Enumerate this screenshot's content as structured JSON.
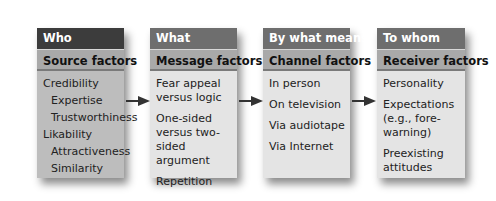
{
  "columns": [
    {
      "question": "Who",
      "factor": "Source factors",
      "items": [
        {
          "text": "Credibility",
          "level": 0
        },
        {
          "text": "Expertise",
          "level": 1
        },
        {
          "text": "Trustworthiness",
          "level": 1
        },
        {
          "text": "Likability",
          "level": 0
        },
        {
          "text": "Attractiveness",
          "level": 1
        },
        {
          "text": "Similarity",
          "level": 1
        }
      ]
    },
    {
      "question": "What",
      "factor": "Message factors",
      "items": [
        {
          "text": "Fear appeal versus logic"
        },
        {
          "text": "One-sided versus two-sided argument"
        },
        {
          "text": "Repetition"
        }
      ]
    },
    {
      "question": "By what means",
      "factor": "Channel factors",
      "items": [
        {
          "text": "In person"
        },
        {
          "text": "On television"
        },
        {
          "text": "Via audiotape"
        },
        {
          "text": "Via Internet"
        }
      ]
    },
    {
      "question": "To whom",
      "factor": "Receiver factors",
      "items": [
        {
          "text": "Personality"
        },
        {
          "text": "Expectations (e.g., fore-warning)"
        },
        {
          "text": "Preexisting attitudes"
        }
      ]
    }
  ],
  "colors": {
    "header_dark_first": "#3c3c3c",
    "header_dark": "#6e6e6e",
    "header_mid": "#a9a9a9",
    "body_first": "#bdbdbd",
    "body": "#e4e4e4",
    "arrow": "#333333"
  }
}
